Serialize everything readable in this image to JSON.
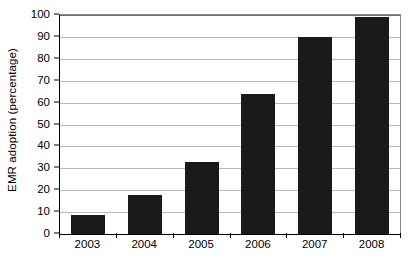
{
  "chart_data": {
    "type": "bar",
    "title": "",
    "xlabel": "",
    "ylabel": "EMR adoption (percentage)",
    "categories": [
      "2003",
      "2004",
      "2005",
      "2006",
      "2007",
      "2008"
    ],
    "values": [
      8.5,
      18,
      33,
      64,
      90,
      99
    ],
    "ylim": [
      0,
      100
    ],
    "ytick_values": [
      0,
      10,
      20,
      30,
      40,
      50,
      60,
      70,
      80,
      90,
      100
    ],
    "ytick_labels": [
      "0",
      "10",
      "20",
      "30",
      "40",
      "50",
      "60",
      "70",
      "80",
      "90",
      "100"
    ],
    "grid": true,
    "grid_axis": "y",
    "legend": false,
    "legend_position": "none",
    "bar_color": "#1a1a1a",
    "grid_color": "#b9b9b9",
    "axis_color": "#000000",
    "background_color": "#ffffff"
  }
}
